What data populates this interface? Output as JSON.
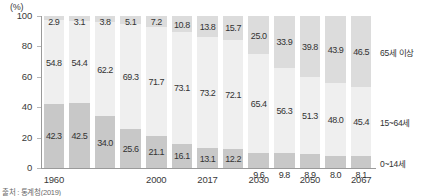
{
  "chart_data": {
    "type": "bar",
    "subtype": "stacked-percentage-column",
    "title": "",
    "xlabel": "",
    "ylabel": "(%)",
    "ylim": [
      0,
      100
    ],
    "yticks": [
      "0",
      "20",
      "40",
      "60",
      "80",
      "100"
    ],
    "grid": false,
    "legend_position": "right",
    "categories": [
      "1960",
      "1970",
      "1980",
      "1990",
      "2000",
      "2010",
      "2017",
      "2020",
      "2030",
      "2040",
      "2050",
      "2060",
      "2067"
    ],
    "visible_tick_labels": [
      "1960",
      "2000",
      "2017",
      "2030",
      "2050",
      "2067"
    ],
    "visible_tick_indices": [
      0,
      4,
      6,
      8,
      10,
      12
    ],
    "series": [
      {
        "name": "65세 이상",
        "color": "#dcdcdc",
        "values": [
          2.9,
          3.1,
          3.8,
          5.1,
          7.2,
          10.8,
          13.8,
          15.7,
          25.0,
          33.9,
          39.8,
          43.9,
          46.5
        ],
        "labels": [
          "2.9",
          "3.1",
          "3.8",
          "5.1",
          "7.2",
          "10.8",
          "13.8",
          "15.7",
          "25.0",
          "33.9",
          "39.8",
          "43.9",
          "46.5"
        ]
      },
      {
        "name": "15~64세",
        "color": "#efefef",
        "values": [
          54.8,
          54.4,
          62.2,
          69.3,
          71.7,
          73.1,
          73.2,
          72.1,
          65.4,
          56.3,
          51.3,
          48.0,
          45.4
        ],
        "labels": [
          "54.8",
          "54.4",
          "62.2",
          "69.3",
          "71.7",
          "73.1",
          "73.2",
          "72.1",
          "65.4",
          "56.3",
          "51.3",
          "48.0",
          "45.4"
        ]
      },
      {
        "name": "0~14세",
        "color": "#c8c8c8",
        "values": [
          42.3,
          42.5,
          34.0,
          25.6,
          21.1,
          16.1,
          13.1,
          12.2,
          9.6,
          9.8,
          8.9,
          8.0,
          8.1
        ],
        "labels": [
          "42.3",
          "42.5",
          "34.0",
          "25.6",
          "21.1",
          "16.1",
          "13.1",
          "12.2",
          "9.6",
          "9.8",
          "8.9",
          "8.0",
          "8.1"
        ]
      }
    ]
  },
  "axis": {
    "unit": "(%)"
  },
  "legend": {
    "old": "65세 이상",
    "working": "15~64세",
    "young": "0~14세"
  },
  "source": {
    "text": "출처 : 통계청(2019)"
  }
}
